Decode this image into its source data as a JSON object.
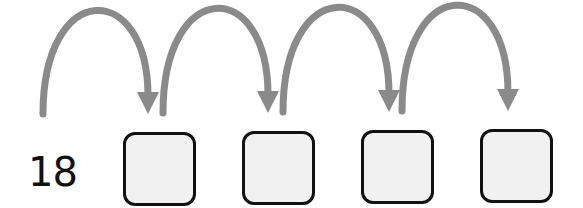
{
  "diagram": {
    "type": "number-line-jumps",
    "start_value": "18",
    "boxes": [
      {
        "value": "",
        "x": 123,
        "y": 132
      },
      {
        "value": "",
        "x": 242,
        "y": 131
      },
      {
        "value": "",
        "x": 361,
        "y": 130
      },
      {
        "value": "",
        "x": 480,
        "y": 129
      }
    ],
    "jumps": [
      {
        "from_x": 43,
        "to_x": 148,
        "base_y": 114,
        "peak_y": 24
      },
      {
        "from_x": 163,
        "to_x": 268,
        "base_y": 113,
        "peak_y": 22
      },
      {
        "from_x": 283,
        "to_x": 389,
        "base_y": 112,
        "peak_y": 21
      },
      {
        "from_x": 402,
        "to_x": 508,
        "base_y": 111,
        "peak_y": 19
      }
    ],
    "colors": {
      "arrow": "#8a8a8a",
      "box_border": "#111111",
      "box_fill": "#f1f1f1",
      "text": "#111111"
    }
  }
}
